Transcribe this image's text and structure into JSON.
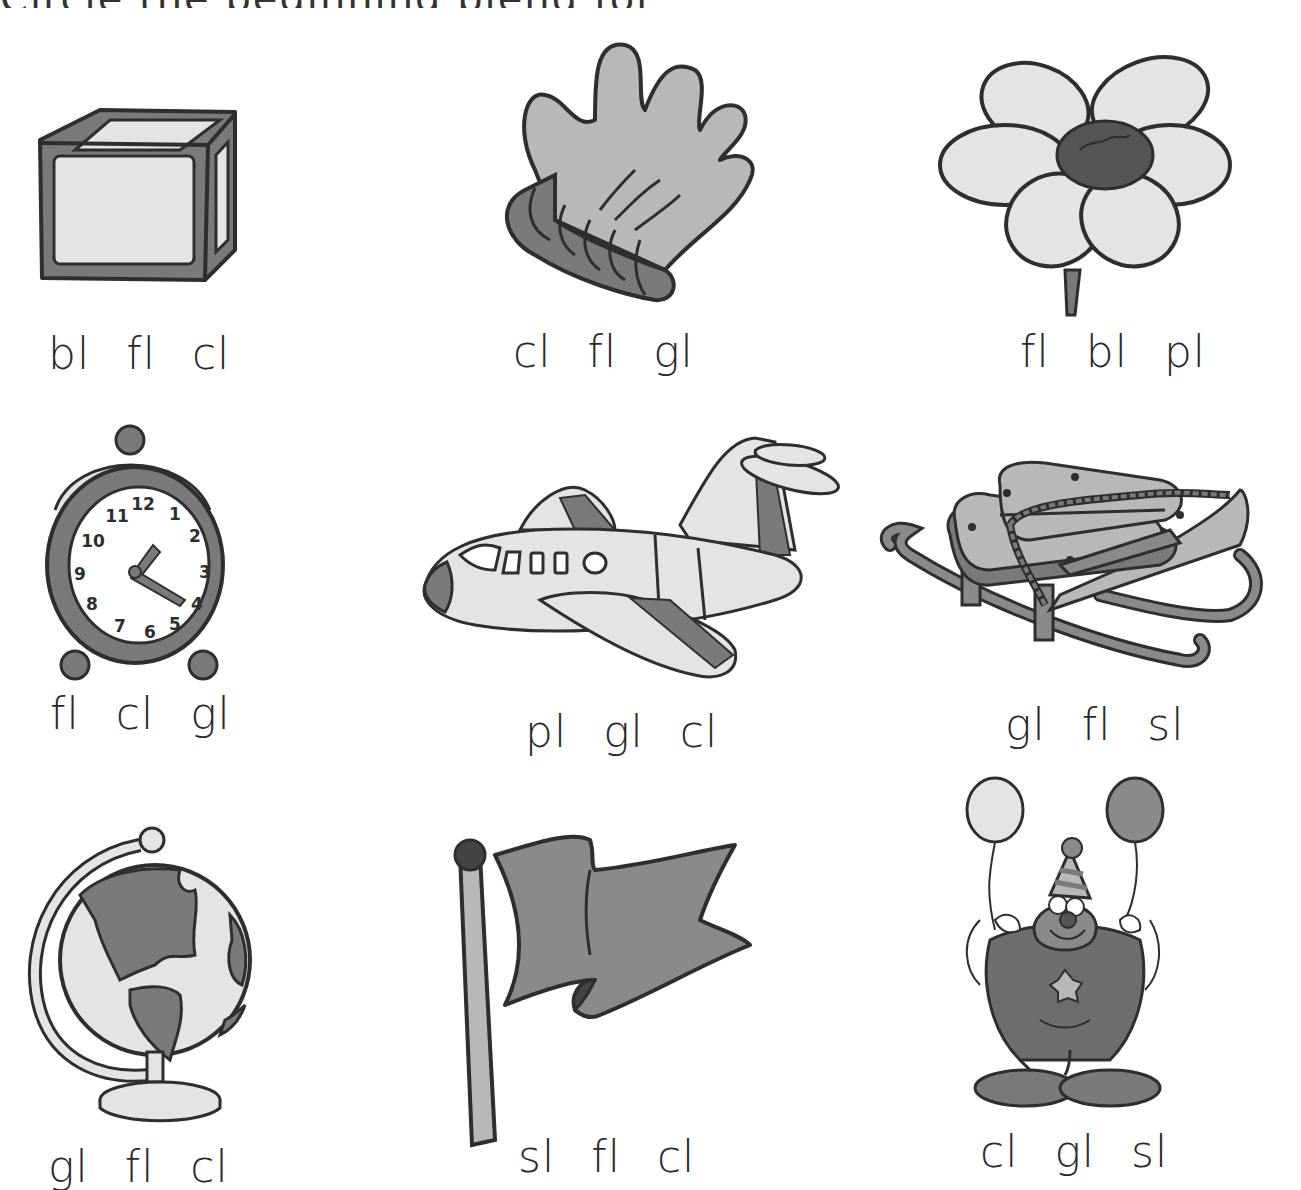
{
  "worksheet": {
    "title_partial": "Circle the beginning blend for each picture.",
    "colors": {
      "outline": "#2e2e2e",
      "light_fill": "#e2e2e2",
      "mid_fill": "#b8b8b8",
      "dark_fill": "#7a7a7a",
      "darker_fill": "#555555",
      "text": "#2a2a2a"
    },
    "items": [
      {
        "picture": "block",
        "choices": [
          "bl",
          "fl",
          "cl"
        ]
      },
      {
        "picture": "glove",
        "choices": [
          "cl",
          "fl",
          "gl"
        ]
      },
      {
        "picture": "flower",
        "choices": [
          "fl",
          "bl",
          "pl"
        ]
      },
      {
        "picture": "clock",
        "choices": [
          "fl",
          "cl",
          "gl"
        ]
      },
      {
        "picture": "plane",
        "choices": [
          "pl",
          "gl",
          "cl"
        ]
      },
      {
        "picture": "sled",
        "choices": [
          "gl",
          "fl",
          "sl"
        ]
      },
      {
        "picture": "globe",
        "choices": [
          "gl",
          "fl",
          "cl"
        ]
      },
      {
        "picture": "flag",
        "choices": [
          "sl",
          "fl",
          "cl"
        ]
      },
      {
        "picture": "clown",
        "choices": [
          "cl",
          "gl",
          "sl"
        ]
      }
    ],
    "clock_numbers": [
      "12",
      "1",
      "2",
      "3",
      "4",
      "5",
      "6",
      "7",
      "8",
      "9",
      "10",
      "11"
    ]
  }
}
